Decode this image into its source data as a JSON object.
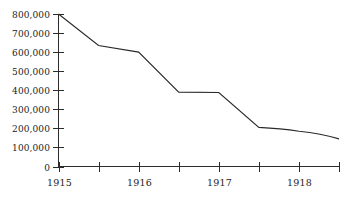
{
  "chart_data": {
    "type": "line",
    "title": "",
    "subtitle": "",
    "xlabel": "",
    "ylabel": "",
    "grid": false,
    "legend": false,
    "legend_position": "none",
    "line_color": "#2a2a2a",
    "axis_color": "#2b2b2b",
    "background_color": "#ffffff",
    "xlim": [
      1915.0,
      1918.5
    ],
    "ylim": [
      0,
      800000
    ],
    "y_ticks": [
      0,
      100000,
      200000,
      300000,
      400000,
      500000,
      600000,
      700000,
      800000
    ],
    "y_tick_labels": [
      "0",
      "100,000",
      "200,000",
      "300,000",
      "400,000",
      "500,000",
      "600,000",
      "700,000",
      "800,000"
    ],
    "x_ticks": [
      1915.0,
      1915.5,
      1916.0,
      1916.5,
      1917.0,
      1917.5,
      1918.0,
      1918.5
    ],
    "x_tick_labels": [
      "1915",
      "",
      "1916",
      "",
      "1917",
      "",
      "1918",
      ""
    ],
    "x_labeled_ticks": [
      {
        "x": 1915.0,
        "label": "1915"
      },
      {
        "x": 1916.0,
        "label": "1916"
      },
      {
        "x": 1917.0,
        "label": "1917"
      },
      {
        "x": 1918.0,
        "label": "1918"
      }
    ],
    "x": [
      1915.0,
      1915.5,
      1916.0,
      1916.5,
      1917.0,
      1917.5,
      1918.0,
      1918.5
    ],
    "values": [
      800000,
      635000,
      600000,
      390000,
      388000,
      205000,
      185000,
      145000
    ],
    "points": [
      {
        "x": 1915.0,
        "y": 800000
      },
      {
        "x": 1915.5,
        "y": 635000
      },
      {
        "x": 1916.0,
        "y": 600000
      },
      {
        "x": 1916.5,
        "y": 390000
      },
      {
        "x": 1917.0,
        "y": 388000
      },
      {
        "x": 1917.5,
        "y": 205000
      },
      {
        "x": 1918.0,
        "y": 185000
      },
      {
        "x": 1918.5,
        "y": 145000
      }
    ],
    "annotations": []
  },
  "axis": {
    "y_labels": [
      "800,000",
      "700,000",
      "600,000",
      "500,000",
      "400,000",
      "300,000",
      "200,000",
      "100,000",
      "0"
    ],
    "x_labels": [
      "1915",
      "1916",
      "1917",
      "1918"
    ]
  }
}
